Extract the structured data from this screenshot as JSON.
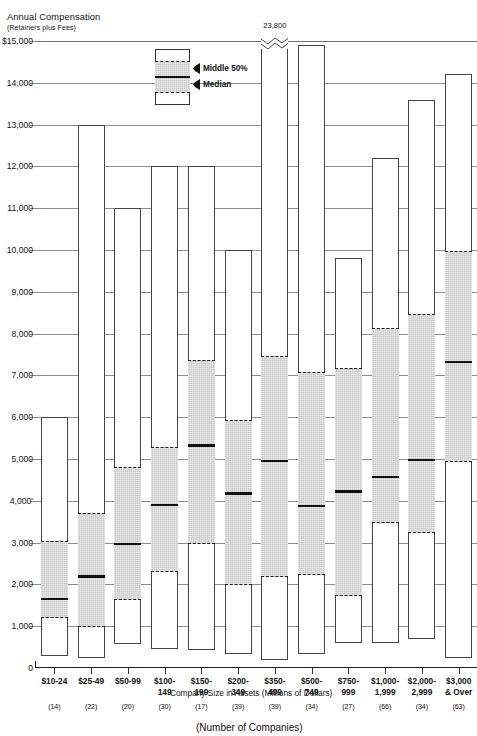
{
  "chart_data": {
    "type": "bar",
    "title": "",
    "ylabel": "Annual Compensation",
    "ylabel_sub": "(Retainers plus Fees)",
    "xlabel": "Company Size in Assets",
    "xlabel_units": "(Millions of Dollars)",
    "xlabel_secondary": "(Number of Companies)",
    "ylim": [
      0,
      15000
    ],
    "yticks": [
      {
        "value": 15000,
        "label": "$15,000"
      },
      {
        "value": 14000,
        "label": "14,000"
      },
      {
        "value": 13000,
        "label": "13,000"
      },
      {
        "value": 12000,
        "label": "12,000"
      },
      {
        "value": 11000,
        "label": "11,000"
      },
      {
        "value": 10000,
        "label": "10,000"
      },
      {
        "value": 9000,
        "label": "9,000"
      },
      {
        "value": 8000,
        "label": "8,000"
      },
      {
        "value": 7000,
        "label": "7,000"
      },
      {
        "value": 6000,
        "label": "6,000"
      },
      {
        "value": 5000,
        "label": "5,000"
      },
      {
        "value": 4000,
        "label": "4,000'"
      },
      {
        "value": 3000,
        "label": "3,000"
      },
      {
        "value": 2000,
        "label": "2,000"
      },
      {
        "value": 1000,
        "label": "1,000"
      },
      {
        "value": 0,
        "label": "0"
      }
    ],
    "grid": true,
    "legend": {
      "position": "top-center",
      "entries": [
        {
          "key": "middle-50",
          "label": "Middle 50%"
        },
        {
          "key": "median",
          "label": "Median"
        }
      ]
    },
    "categories": [
      "$10-24",
      "$25-49",
      "$50-99",
      "$100-\n149",
      "$150-\n199",
      "$200-\n349",
      "$350-\n499",
      "$500-\n749",
      "$750-\n999",
      "$1,000-\n1,999",
      "$2,000-\n2,999",
      "$3,000\n& Over"
    ],
    "company_counts": [
      "(14)",
      "(22)",
      "(20)",
      "(30)",
      "(17)",
      "(39)",
      "(39)",
      "(34)",
      "(27)",
      "(66)",
      "(34)",
      "(63)"
    ],
    "series": [
      {
        "name": "max",
        "values": [
          6000,
          13000,
          11000,
          12000,
          12000,
          10000,
          23800,
          14900,
          9800,
          12200,
          13600,
          14200
        ]
      },
      {
        "name": "q3",
        "values": [
          3050,
          3720,
          4830,
          5300,
          7400,
          5950,
          7500,
          7100,
          7200,
          8150,
          8500,
          10000
        ]
      },
      {
        "name": "median",
        "values": [
          1680,
          2220,
          3000,
          3930,
          5350,
          4200,
          4980,
          3900,
          4250,
          4600,
          5000,
          7350
        ]
      },
      {
        "name": "q1",
        "values": [
          1230,
          1000,
          1650,
          2330,
          3000,
          2000,
          2200,
          2250,
          1750,
          3500,
          3250,
          4950
        ]
      },
      {
        "name": "min",
        "values": [
          280,
          240,
          580,
          450,
          420,
          340,
          180,
          330,
          600,
          600,
          700,
          250
        ]
      }
    ],
    "annotations": [
      {
        "series_index": 6,
        "text": "23,800",
        "type": "axis-break-top-value"
      }
    ]
  }
}
